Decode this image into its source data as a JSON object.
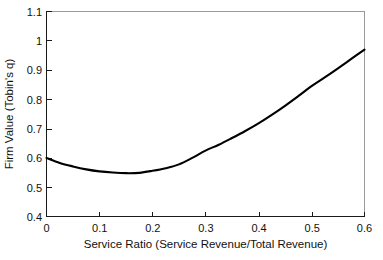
{
  "chart_data": {
    "type": "line",
    "title": "",
    "subtitle": "",
    "xlabel": "Service Ratio (Service Revenue/Total Revenue)",
    "ylabel": "Firm Value (Tobin's q)",
    "xlim": [
      0,
      0.6
    ],
    "ylim": [
      0.4,
      1.1
    ],
    "xticks": [
      0,
      0.1,
      0.2,
      0.3,
      0.4,
      0.5,
      0.6
    ],
    "xtick_labels": [
      "0",
      "0.1",
      "0.2",
      "0.3",
      "0.4",
      "0.5",
      "0.6"
    ],
    "yticks": [
      0.4,
      0.5,
      0.6,
      0.7,
      0.8,
      0.9,
      1.0,
      1.1
    ],
    "ytick_labels": [
      "0.4",
      "0.5",
      "0.6",
      "0.7",
      "0.8",
      "0.9",
      "1",
      "1.1"
    ],
    "grid": false,
    "legend": false,
    "legend_position": "none",
    "annotations": [],
    "series": [
      {
        "name": "Firm Value vs Service Ratio",
        "color": "#000000",
        "line_width": 2.1,
        "x": [
          0.0,
          0.025,
          0.05,
          0.075,
          0.1,
          0.125,
          0.15,
          0.175,
          0.2,
          0.225,
          0.25,
          0.275,
          0.3,
          0.325,
          0.35,
          0.375,
          0.4,
          0.425,
          0.45,
          0.475,
          0.5,
          0.525,
          0.55,
          0.575,
          0.6
        ],
        "values": [
          0.6,
          0.583,
          0.571,
          0.561,
          0.554,
          0.55,
          0.548,
          0.549,
          0.556,
          0.565,
          0.578,
          0.6,
          0.625,
          0.645,
          0.668,
          0.692,
          0.718,
          0.747,
          0.778,
          0.811,
          0.845,
          0.875,
          0.906,
          0.938,
          0.97
        ]
      }
    ],
    "minimum": {
      "x": 0.15,
      "y": 0.548
    },
    "endpoints": {
      "left": {
        "x": 0.0,
        "y": 0.6
      },
      "right": {
        "x": 0.6,
        "y": 0.97
      }
    }
  },
  "colors": {
    "curve": "#000000",
    "axis": "#1a1a1a",
    "frame": "#9a9a9a",
    "background": "#ffffff",
    "text": "#111111"
  }
}
